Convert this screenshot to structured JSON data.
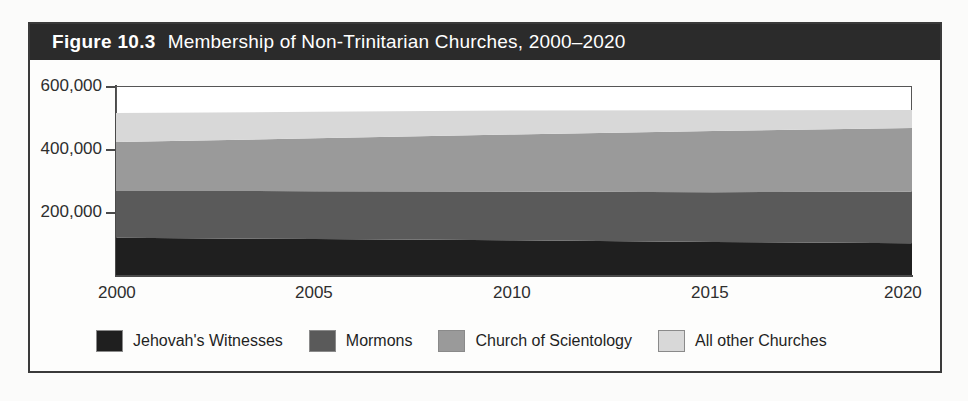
{
  "figure": {
    "label": "Figure 10.3",
    "title": "Membership of Non-Trinitarian Churches, 2000–2020"
  },
  "axes": {
    "y_ticks": [
      "600,000",
      "400,000",
      "200,000"
    ],
    "x_ticks": [
      "2000",
      "2005",
      "2010",
      "2015",
      "2020"
    ]
  },
  "legend": {
    "items": [
      {
        "label": "Jehovah's Witnesses",
        "color": "#1f1f1f"
      },
      {
        "label": "Mormons",
        "color": "#5a5a5a"
      },
      {
        "label": "Church of Scientology",
        "color": "#9a9a9a"
      },
      {
        "label": "All other Churches",
        "color": "#d8d8d8"
      }
    ]
  },
  "chart_data": {
    "type": "area",
    "stacked": true,
    "title": "Membership of Non-Trinitarian Churches, 2000–2020",
    "xlabel": "",
    "ylabel": "",
    "x": [
      2000,
      2005,
      2010,
      2015,
      2020
    ],
    "xlim": [
      2000,
      2020
    ],
    "ylim": [
      0,
      600000
    ],
    "yticks": [
      200000,
      400000,
      600000
    ],
    "grid": false,
    "legend_position": "bottom",
    "series": [
      {
        "name": "Jehovah's Witnesses",
        "color": "#1f1f1f",
        "values": [
          118000,
          114000,
          110000,
          105000,
          101000
        ]
      },
      {
        "name": "Mormons",
        "color": "#5a5a5a",
        "values": [
          149000,
          152000,
          155000,
          158000,
          163000
        ]
      },
      {
        "name": "Church of Scientology",
        "color": "#9a9a9a",
        "values": [
          155000,
          168000,
          181000,
          194000,
          203000
        ]
      },
      {
        "name": "All other Churches",
        "color": "#d8d8d8",
        "values": [
          92000,
          84000,
          76000,
          66000,
          57000
        ]
      }
    ],
    "cumulative_totals": [
      514000,
      518000,
      522000,
      523000,
      524000
    ]
  }
}
